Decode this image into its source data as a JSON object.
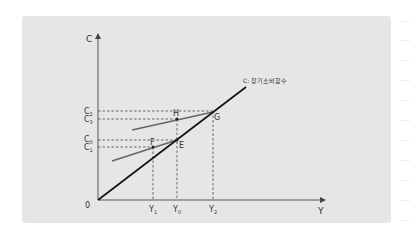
{
  "diagram": {
    "y_axis_label": "C",
    "x_axis_label": "Y",
    "origin_label": "0",
    "curve_label": "C: 장기소비함수",
    "y_ticks": [
      {
        "id": "C2",
        "base": "C",
        "sub": "2"
      },
      {
        "id": "C3",
        "base": "C",
        "sub": "3"
      },
      {
        "id": "C0",
        "base": "C",
        "sub": "0"
      },
      {
        "id": "C1",
        "base": "C",
        "sub": "1"
      }
    ],
    "x_ticks": [
      {
        "id": "Y1",
        "base": "Y",
        "sub": "1"
      },
      {
        "id": "Y0",
        "base": "Y",
        "sub": "0"
      },
      {
        "id": "Y2",
        "base": "Y",
        "sub": "2"
      }
    ],
    "points": {
      "E": "E",
      "F": "F",
      "G": "G",
      "H": "H"
    },
    "colors": {
      "panel": "#e6e6e6",
      "long_run_line": "#111111",
      "short_run_line": "#666666",
      "axis": "#555555"
    }
  }
}
